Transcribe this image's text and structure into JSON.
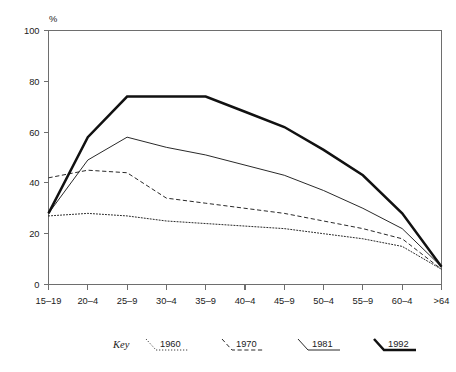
{
  "chart_data": {
    "type": "line",
    "title": "",
    "xlabel": "",
    "ylabel": "%",
    "ylim": [
      0,
      100
    ],
    "yticks": [
      0,
      20,
      40,
      60,
      80,
      100
    ],
    "grid": false,
    "legend_position": "below",
    "legend_title": "Key",
    "categories": [
      "15–19",
      "20–4",
      "25–9",
      "30–4",
      "35–9",
      "40–4",
      "45–9",
      "50–4",
      "55–9",
      "60–4",
      ">64"
    ],
    "series": [
      {
        "name": "1960",
        "style": "dotted",
        "values": [
          27,
          28,
          27,
          25,
          24,
          23,
          22,
          20,
          18,
          15,
          6
        ]
      },
      {
        "name": "1970",
        "style": "dashed",
        "values": [
          42,
          45,
          44,
          34,
          32,
          30,
          28,
          25,
          22,
          18,
          6
        ]
      },
      {
        "name": "1981",
        "style": "thin-solid",
        "values": [
          28,
          49,
          58,
          54,
          51,
          47,
          43,
          37,
          30,
          22,
          7
        ]
      },
      {
        "name": "1992",
        "style": "thick-solid",
        "values": [
          28,
          58,
          74,
          74,
          74,
          68,
          62,
          53,
          43,
          28,
          7
        ]
      }
    ]
  },
  "axes": {
    "y_unit_label": "%"
  }
}
